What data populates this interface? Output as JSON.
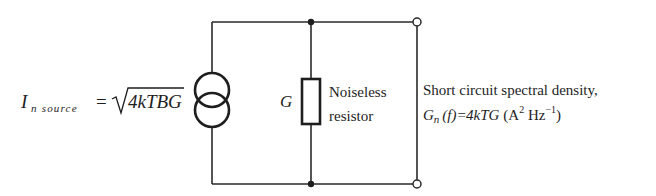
{
  "diagram": {
    "type": "circuit",
    "source_label": {
      "symbol": "I",
      "subscript": "n source",
      "equals": "=",
      "radical_content": "4kTBG"
    },
    "conductance_label": "G",
    "resistor_label": {
      "line1": "Noiseless",
      "line2": "resistor"
    },
    "output_label": {
      "line1": "Short circuit spectral density,",
      "line2": {
        "lhs_symbol": "G",
        "lhs_subscript": "n",
        "lhs_arg": "(f)",
        "equals": "=",
        "rhs": "4kTG",
        "units_open": "(A",
        "units_sup1": "2",
        "units_mid": " Hz",
        "units_sup2": "−1",
        "units_close": ")"
      }
    },
    "components": [
      {
        "id": "current-source",
        "kind": "noise current source (dual-circle symbol)"
      },
      {
        "id": "resistor",
        "kind": "resistor (rectangle)",
        "value": "G"
      },
      {
        "id": "terminal-top",
        "kind": "open terminal"
      },
      {
        "id": "terminal-bottom",
        "kind": "open terminal"
      }
    ],
    "nodes": [
      {
        "id": "junction-top",
        "kind": "solid dot"
      },
      {
        "id": "junction-bottom",
        "kind": "solid dot"
      }
    ],
    "colors": {
      "ink": "#1e1e1e",
      "background": "#ffffff"
    }
  }
}
